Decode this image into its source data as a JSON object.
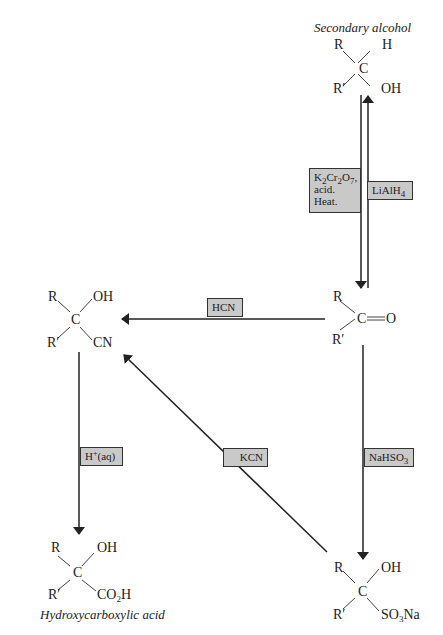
{
  "molecules": {
    "secondary_alcohol": {
      "caption": "Secondary alcohol",
      "top_left": "R",
      "top_right": "H",
      "center": "C",
      "bottom_left": "R′",
      "bottom_right": "OH"
    },
    "ketone": {
      "top_left": "R",
      "center": "C",
      "double_bond": "═",
      "right": "O",
      "bottom_left": "R′"
    },
    "cyanohydrin": {
      "top_left": "R",
      "top_right": "OH",
      "center": "C",
      "bottom_left": "R′",
      "bottom_right": "CN"
    },
    "hydroxycarboxylic_acid": {
      "caption": "Hydroxycarboxylic acid",
      "top_left": "R",
      "top_right": "OH",
      "center": "C",
      "bottom_left": "R′",
      "bottom_right_main": "CO",
      "bottom_right_sub": "2",
      "bottom_right_end": "H"
    },
    "bisulfite_adduct": {
      "top_left": "R",
      "top_right": "OH",
      "center": "C",
      "bottom_left": "R′",
      "bottom_right_main": "SO",
      "bottom_right_sub": "3",
      "bottom_right_end": "Na"
    }
  },
  "reagents": {
    "oxidation": {
      "line1_a": "K",
      "line1_sub1": "2",
      "line1_b": "Cr",
      "line1_sub2": "2",
      "line1_c": "O",
      "line1_sub3": "7",
      "line1_d": ",",
      "line2": "acid.",
      "line3": "Heat."
    },
    "reduction": {
      "main": "LiAlH",
      "sub": "4"
    },
    "hcn": "HCN",
    "hydrolysis": {
      "main": "H",
      "sup": "+",
      "end": "(aq)"
    },
    "kcn": "KCN",
    "bisulfite": {
      "main": "NaHSO",
      "sub": "3"
    }
  },
  "colors": {
    "reagent_box_fill": "#c9c9c9",
    "line": "#333333",
    "background": "#ffffff"
  }
}
